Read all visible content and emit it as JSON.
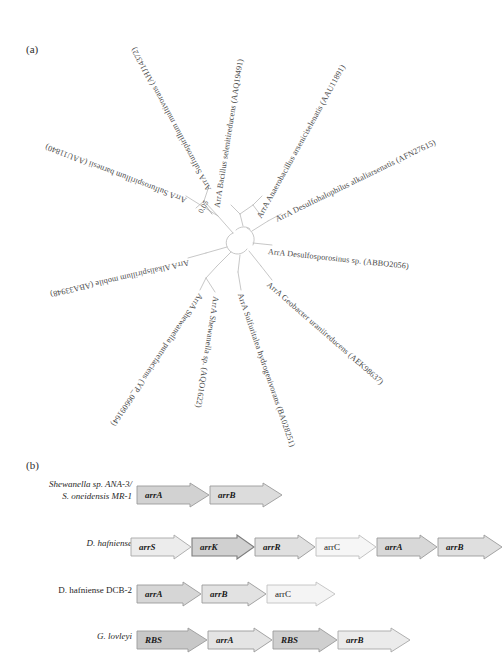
{
  "figure": {
    "panel_a_letter": "(a)",
    "panel_b_letter": "(b)"
  },
  "tree": {
    "scale_bar_label": "0.05",
    "leaves": [
      {
        "id": "sulfurospirillum-multivorans",
        "label": "ArrA Sulfurospirillum multivorans (AHJ14372)",
        "genus_species": "Sulfurospirillum multivorans",
        "accession": "AHJ14372",
        "angle_deg": -118
      },
      {
        "id": "bacillus-selenitireducens",
        "label": "ArrA Bacillus selenitireducens (AAQ19491)",
        "genus_species": "Bacillus selenitireducens",
        "accession": "AAQ19491",
        "angle_deg": -83
      },
      {
        "id": "anaerobacillus-arseniciselenatis",
        "label": "ArrA Anaerobacillus arseniciselenatis (AAU11891)",
        "genus_species": "Anaerobacillus arseniciselenatis",
        "accession": "AAU11891",
        "angle_deg": -62
      },
      {
        "id": "desulfohalophilus-alkaliarsenatis",
        "label": "ArrA Desulfohalophilus alkaliarsenatis (AFN27615)",
        "genus_species": "Desulfohalophilus alkaliarsenatis",
        "accession": "AFN27615",
        "angle_deg": -28
      },
      {
        "id": "desulfosporosinus-sp",
        "label": "ArrA Desulfosporosinus sp. (ABBO2056)",
        "genus_species": "Desulfosporosinus sp.",
        "accession": "ABBO2056",
        "angle_deg": 6
      },
      {
        "id": "geobacter-uraniireducens",
        "label": "ArrA Geobacter uraniireducens (AEK98637)",
        "genus_species": "Geobacter uraniireducens",
        "accession": "AEK98637",
        "angle_deg": 42
      },
      {
        "id": "sulfurihydrogenibium",
        "label": "ArrA Sulfuritalea hydrogenivorans (BA028251)",
        "genus_species": "Sulfuritalea hydrogenivorans",
        "accession": "BA028251",
        "angle_deg": 72
      },
      {
        "id": "shewanella-sp",
        "label": "ArrA Shewanella sp. (AQO1622)",
        "genus_species": "Shewanella sp.",
        "accession": "AQO1622",
        "angle_deg": 99
      },
      {
        "id": "shewanella-putrefaciens",
        "label": "ArrA Shewanella putrefaciens (YP_06609164)",
        "genus_species": "Shewanella putrefaciens",
        "accession": "YP_06609164",
        "angle_deg": 125
      },
      {
        "id": "alkalispirillum-mobile",
        "label": "ArrA Alkalispirillum mobile (ABA33948)",
        "genus_species": "Alkalispirillum mobile",
        "accession": "ABA33948",
        "angle_deg": 168
      },
      {
        "id": "sulfurospirillum-barnesii",
        "label": "ArrA Sulfurospirillum barnesii (AAU11840)",
        "genus_species": "Sulfurospirillum barnesii",
        "accession": "AAU11840",
        "angle_deg": -160
      }
    ]
  },
  "gene_clusters": {
    "rows": [
      {
        "id": "shewanella-ana3",
        "organism_lines": [
          "Shewanella sp. ANA-3/",
          "S. oneidensis MR-1"
        ],
        "organism_italic_parts": [
          "Shewanella",
          "S. oneidensis"
        ],
        "genes": [
          {
            "name": "arrA",
            "width": 74,
            "fill": "#d2d2d2",
            "italic": true
          },
          {
            "name": "arrB",
            "width": 74,
            "fill": "#dcdcdc",
            "italic": true
          }
        ]
      },
      {
        "id": "d-hafniense",
        "organism_lines": [
          "D. hafniense"
        ],
        "organism_italic_parts": [
          "D. hafniense"
        ],
        "genes": [
          {
            "name": "arrS",
            "width": 62,
            "fill": "#ececec",
            "italic": true
          },
          {
            "name": "arrK",
            "width": 64,
            "fill": "#d0d0d0",
            "italic": true
          },
          {
            "name": "arrR",
            "width": 62,
            "fill": "#e0e0e0",
            "italic": true
          },
          {
            "name": "arrC",
            "width": 62,
            "fill": "#f6f6f6",
            "italic": false
          },
          {
            "name": "arrA",
            "width": 62,
            "fill": "#d8d8d8",
            "italic": true
          },
          {
            "name": "arrB",
            "width": 66,
            "fill": "#dfdfdf",
            "italic": true
          }
        ]
      },
      {
        "id": "d-hafniense-dcb2",
        "organism_lines": [
          "D. hafniense DCB-2"
        ],
        "organism_italic_parts": [
          "D. hafniense"
        ],
        "genes": [
          {
            "name": "arrA",
            "width": 66,
            "fill": "#d6d6d6",
            "italic": true
          },
          {
            "name": "arrB",
            "width": 66,
            "fill": "#e2e2e2",
            "italic": true
          },
          {
            "name": "arrC",
            "width": 70,
            "fill": "#f4f4f4",
            "italic": false
          }
        ]
      },
      {
        "id": "g-lovleyi",
        "organism_lines": [
          "G. lovleyi"
        ],
        "organism_italic_parts": [
          "G. lovleyi"
        ],
        "genes": [
          {
            "name": "RBS",
            "width": 72,
            "fill": "#c8c8c8",
            "italic": true
          },
          {
            "name": "arrA",
            "width": 66,
            "fill": "#e4e4e4",
            "italic": true
          },
          {
            "name": "RBS",
            "width": 66,
            "fill": "#cfcfcf",
            "italic": true
          },
          {
            "name": "arrB",
            "width": 74,
            "fill": "#ebebeb",
            "italic": true
          }
        ]
      }
    ]
  }
}
